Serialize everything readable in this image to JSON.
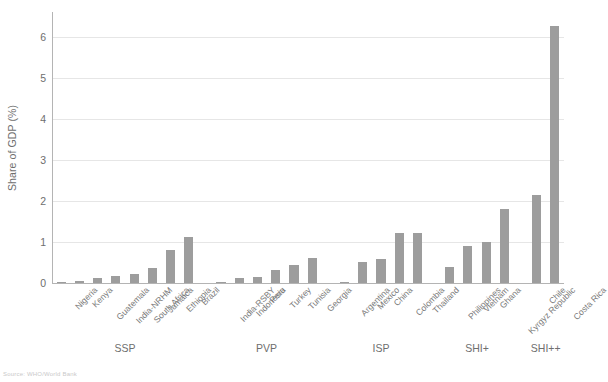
{
  "chart_data": {
    "type": "bar",
    "title": "",
    "xlabel": "",
    "ylabel": "Share of GDP (%)",
    "ylim": [
      0,
      6.6
    ],
    "yticks": [
      0,
      1,
      2,
      3,
      4,
      5,
      6
    ],
    "ytick_labels": [
      "0",
      "1",
      "2",
      "3",
      "4",
      "5",
      "6"
    ],
    "grid": true,
    "legend": "none",
    "bar_color": "#9d9d9d",
    "categories": [
      "Nigeria",
      "Kenya",
      "Guatemala",
      "India-NRHM",
      "South Africa",
      "Jamaica",
      "Ethiopia",
      "Brazil",
      "India-RSBY",
      "Indonesia",
      "Peru",
      "Turkey",
      "Tunisia",
      "Georgia",
      "Argentina",
      "Mexico",
      "China",
      "Colombia",
      "Thailand",
      "Philippines",
      "Vietnam",
      "Ghana",
      "Kyrgyz Republic",
      "Chile",
      "Costa Rica"
    ],
    "values": [
      0.02,
      0.04,
      0.12,
      0.18,
      0.22,
      0.36,
      0.8,
      1.12,
      0.02,
      0.12,
      0.14,
      0.31,
      0.44,
      0.62,
      0.03,
      0.5,
      0.59,
      1.21,
      1.21,
      0.39,
      0.9,
      1.01,
      1.8,
      2.14,
      6.25
    ],
    "groups": [
      {
        "label": "SSP",
        "start": 0,
        "count": 8
      },
      {
        "label": "PVP",
        "start": 8,
        "count": 6
      },
      {
        "label": "ISP",
        "start": 14,
        "count": 5
      },
      {
        "label": "SHI+",
        "start": 19,
        "count": 4
      },
      {
        "label": "SHI++",
        "start": 23,
        "count": 2
      }
    ]
  },
  "source_note": "Source: WHO/World Bank"
}
